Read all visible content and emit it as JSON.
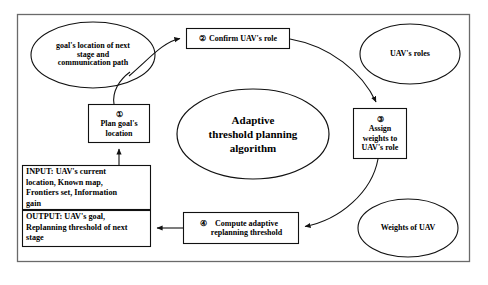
{
  "diagram": {
    "title_ellipse": "Adaptive\nthreshold planning\nalgorithm",
    "frame": {
      "border_color": "#555555",
      "background": "#ffffff"
    },
    "nodes": {
      "goal_location_ellipse": "goal's location of next\nstage and\ncommunication path",
      "uav_roles_ellipse": "UAV's roles",
      "weights_ellipse": "Weights of UAV",
      "step1": {
        "number": "①",
        "label": "Plan goal's\nlocation"
      },
      "step2": {
        "number": "②",
        "label": "Confirm UAV's role"
      },
      "step3": {
        "number": "③",
        "label": "Assign\nweights to\nUAV's role"
      },
      "step4": {
        "number": "④",
        "label": "Compute adaptive\nreplanning threshold"
      },
      "input_box": "INPUT: UAV's current\nlocation, Known map,\nFrontiers set, Information\ngain",
      "output_box": "OUTPUT: UAV's goal,\nReplanning threshold of next\nstage"
    },
    "edges": [
      {
        "from": "step1",
        "to": "goal_location_ellipse",
        "style": "curve"
      },
      {
        "from": "goal_location_ellipse",
        "to": "step2",
        "style": "curve-arrow"
      },
      {
        "from": "step2",
        "to": "step3",
        "style": "curve-arrow"
      },
      {
        "from": "step3",
        "to": "step4",
        "style": "curve-arrow"
      },
      {
        "from": "step4",
        "to": "output_box",
        "style": "straight-arrow-left"
      },
      {
        "from": "input_box",
        "to": "step1",
        "style": "straight-arrow-up"
      }
    ]
  }
}
